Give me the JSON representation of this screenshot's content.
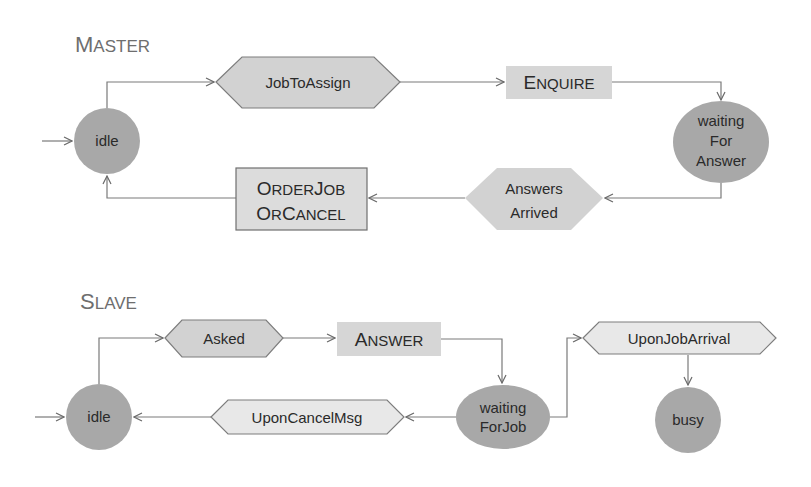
{
  "colors": {
    "state_fill": "#a8a8a8",
    "event_hex_fill": "#d2d2d2",
    "event_hex_light_fill": "#e8e8e8",
    "action_box_fill": "#d6d6d6",
    "edge": "#7a7a7a",
    "title": "#6e6e6e"
  },
  "master": {
    "title_first": "M",
    "title_rest": "ASTER",
    "states": {
      "idle": "idle",
      "waiting_line1": "waiting",
      "waiting_line2": "For",
      "waiting_line3": "Answer"
    },
    "events": {
      "job_to_assign": "JobToAssign",
      "answers_arrived_line1": "Answers",
      "answers_arrived_line2": "Arrived"
    },
    "actions": {
      "enquire_first": "E",
      "enquire_rest": "NQUIRE",
      "orderjob_l1_first": "O",
      "orderjob_l1_rest": "RDER",
      "orderjob_l1_j": "J",
      "orderjob_l1_rest2": "OB",
      "orderjob_l2_first": "O",
      "orderjob_l2_rest": "R",
      "orderjob_l2_c": "C",
      "orderjob_l2_rest2": "ANCEL"
    }
  },
  "slave": {
    "title_first": "S",
    "title_rest": "LAVE",
    "states": {
      "idle": "idle",
      "waiting_line1": "waiting",
      "waiting_line2": "ForJob",
      "busy": "busy"
    },
    "events": {
      "asked": "Asked",
      "upon_cancel_msg": "UponCancelMsg",
      "upon_job_arrival": "UponJobArrival"
    },
    "actions": {
      "answer_first": "A",
      "answer_rest": "NSWER"
    }
  }
}
